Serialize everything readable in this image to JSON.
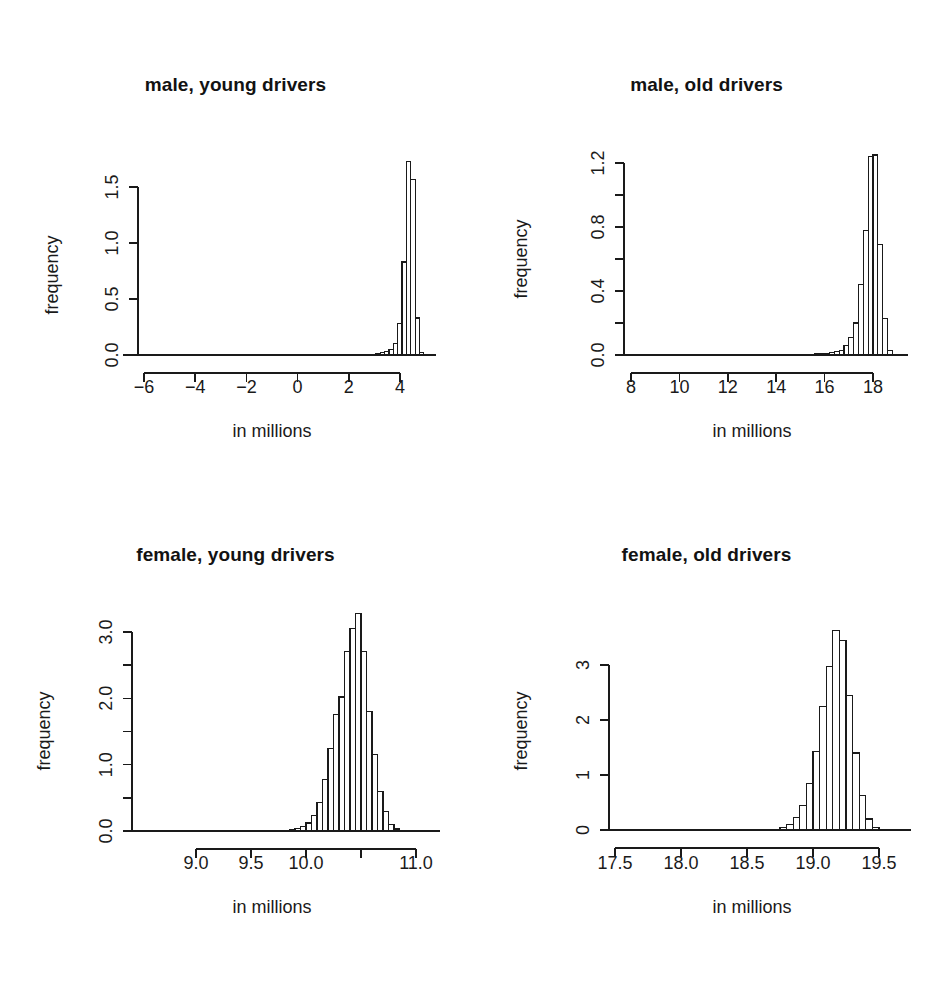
{
  "figure": {
    "width": 942,
    "height": 988,
    "background": "#ffffff",
    "ink_color": "#1a1a1a",
    "layout": "2x2 panel grid of histograms",
    "shared_xlabel": "in millions",
    "shared_ylabel": "frequency"
  },
  "chart_data": [
    {
      "id": "male-young",
      "type": "bar",
      "subtype": "histogram",
      "title": "male, young drivers",
      "xlabel": "in millions",
      "ylabel": "frequency",
      "grid": false,
      "legend": "none",
      "xlim": [
        -6.9,
        5.3
      ],
      "ylim": [
        0.0,
        1.78
      ],
      "xticks": [
        -6,
        -4,
        -2,
        0,
        2,
        4
      ],
      "xtick_labels": [
        "−6",
        "−4",
        "−2",
        "0",
        "2",
        "4"
      ],
      "yticks": [
        0.0,
        0.5,
        1.0,
        1.5
      ],
      "ytick_labels": [
        "0.0",
        "0.5",
        "1.0",
        "1.5"
      ],
      "ytick_minor": [],
      "bin_width": 0.17,
      "bins": [
        {
          "x0": -6.8,
          "x1": -6.63,
          "height": 0.0
        },
        {
          "x0": -6.63,
          "x1": -6.46,
          "height": 0.0
        },
        {
          "x0": -6.46,
          "x1": -6.29,
          "height": 0.0
        },
        {
          "x0": -6.29,
          "x1": -6.12,
          "height": 0.0
        },
        {
          "x0": -6.12,
          "x1": -5.95,
          "height": 0.0
        },
        {
          "x0": 2.55,
          "x1": 2.72,
          "height": 0.004
        },
        {
          "x0": 2.72,
          "x1": 2.89,
          "height": 0.006
        },
        {
          "x0": 2.89,
          "x1": 3.06,
          "height": 0.008
        },
        {
          "x0": 3.06,
          "x1": 3.23,
          "height": 0.012
        },
        {
          "x0": 3.23,
          "x1": 3.4,
          "height": 0.02
        },
        {
          "x0": 3.4,
          "x1": 3.57,
          "height": 0.03
        },
        {
          "x0": 3.57,
          "x1": 3.74,
          "height": 0.05
        },
        {
          "x0": 3.74,
          "x1": 3.91,
          "height": 0.1
        },
        {
          "x0": 3.91,
          "x1": 4.08,
          "height": 0.28
        },
        {
          "x0": 4.08,
          "x1": 4.25,
          "height": 0.83
        },
        {
          "x0": 4.25,
          "x1": 4.42,
          "height": 1.73
        },
        {
          "x0": 4.42,
          "x1": 4.59,
          "height": 1.57
        },
        {
          "x0": 4.59,
          "x1": 4.76,
          "height": 0.33
        },
        {
          "x0": 4.76,
          "x1": 4.93,
          "height": 0.02
        }
      ]
    },
    {
      "id": "male-old",
      "type": "bar",
      "subtype": "histogram",
      "title": "male, old drivers",
      "xlabel": "in millions",
      "ylabel": "frequency",
      "grid": false,
      "legend": "none",
      "xlim": [
        7.0,
        19.2
      ],
      "ylim": [
        0.0,
        1.3
      ],
      "xticks": [
        8,
        10,
        12,
        14,
        16,
        18
      ],
      "xtick_labels": [
        "8",
        "10",
        "12",
        "14",
        "16",
        "18"
      ],
      "yticks": [
        0.0,
        0.4,
        0.8,
        1.2
      ],
      "ytick_labels": [
        "0.0",
        "0.4",
        "0.8",
        "1.2"
      ],
      "ytick_minor": [
        0.2,
        0.6,
        1.0
      ],
      "bin_width": 0.2,
      "bins": [
        {
          "x0": 15.6,
          "x1": 15.8,
          "height": 0.006
        },
        {
          "x0": 15.8,
          "x1": 16.0,
          "height": 0.008
        },
        {
          "x0": 16.0,
          "x1": 16.2,
          "height": 0.01
        },
        {
          "x0": 16.2,
          "x1": 16.4,
          "height": 0.015
        },
        {
          "x0": 16.4,
          "x1": 16.6,
          "height": 0.02
        },
        {
          "x0": 16.6,
          "x1": 16.8,
          "height": 0.03
        },
        {
          "x0": 16.8,
          "x1": 17.0,
          "height": 0.06
        },
        {
          "x0": 17.0,
          "x1": 17.2,
          "height": 0.11
        },
        {
          "x0": 17.2,
          "x1": 17.4,
          "height": 0.2
        },
        {
          "x0": 17.4,
          "x1": 17.6,
          "height": 0.44
        },
        {
          "x0": 17.6,
          "x1": 17.8,
          "height": 0.78
        },
        {
          "x0": 17.8,
          "x1": 18.0,
          "height": 1.24
        },
        {
          "x0": 18.0,
          "x1": 18.2,
          "height": 1.25
        },
        {
          "x0": 18.2,
          "x1": 18.4,
          "height": 0.69
        },
        {
          "x0": 18.4,
          "x1": 18.6,
          "height": 0.23
        },
        {
          "x0": 18.6,
          "x1": 18.8,
          "height": 0.03
        }
      ]
    },
    {
      "id": "female-young",
      "type": "bar",
      "subtype": "histogram",
      "title": "female, young drivers",
      "xlabel": "in millions",
      "ylabel": "frequency",
      "grid": false,
      "legend": "none",
      "xlim": [
        8.72,
        11.12
      ],
      "ylim": [
        0.0,
        3.35
      ],
      "xticks": [
        9.0,
        9.5,
        10.0,
        10.5,
        11.0
      ],
      "xtick_labels": [
        "9.0",
        "9.5",
        "10.0",
        "",
        "11.0"
      ],
      "yticks": [
        0.0,
        0.5,
        1.0,
        1.5,
        2.0,
        2.5,
        3.0
      ],
      "ytick_labels": [
        "0.0",
        "",
        "1.0",
        "",
        "2.0",
        "",
        "3.0"
      ],
      "ytick_minor": [],
      "bin_width": 0.05,
      "bins": [
        {
          "x0": 9.85,
          "x1": 9.9,
          "height": 0.02
        },
        {
          "x0": 9.9,
          "x1": 9.95,
          "height": 0.04
        },
        {
          "x0": 9.95,
          "x1": 10.0,
          "height": 0.07
        },
        {
          "x0": 10.0,
          "x1": 10.05,
          "height": 0.12
        },
        {
          "x0": 10.05,
          "x1": 10.1,
          "height": 0.23
        },
        {
          "x0": 10.1,
          "x1": 10.15,
          "height": 0.43
        },
        {
          "x0": 10.15,
          "x1": 10.2,
          "height": 0.78
        },
        {
          "x0": 10.2,
          "x1": 10.25,
          "height": 1.25
        },
        {
          "x0": 10.25,
          "x1": 10.3,
          "height": 1.75
        },
        {
          "x0": 10.3,
          "x1": 10.35,
          "height": 2.02
        },
        {
          "x0": 10.35,
          "x1": 10.4,
          "height": 2.7
        },
        {
          "x0": 10.4,
          "x1": 10.45,
          "height": 3.05
        },
        {
          "x0": 10.45,
          "x1": 10.5,
          "height": 3.28
        },
        {
          "x0": 10.5,
          "x1": 10.55,
          "height": 2.7
        },
        {
          "x0": 10.55,
          "x1": 10.6,
          "height": 1.8
        },
        {
          "x0": 10.6,
          "x1": 10.65,
          "height": 1.15
        },
        {
          "x0": 10.65,
          "x1": 10.7,
          "height": 0.6
        },
        {
          "x0": 10.7,
          "x1": 10.75,
          "height": 0.3
        },
        {
          "x0": 10.75,
          "x1": 10.8,
          "height": 0.1
        },
        {
          "x0": 10.8,
          "x1": 10.85,
          "height": 0.03
        }
      ]
    },
    {
      "id": "female-old",
      "type": "bar",
      "subtype": "histogram",
      "title": "female, old drivers",
      "xlabel": "in millions",
      "ylabel": "frequency",
      "grid": false,
      "legend": "none",
      "xlim": [
        17.28,
        19.72
      ],
      "ylim": [
        0.0,
        3.8
      ],
      "xticks": [
        17.5,
        18.0,
        18.5,
        19.0,
        19.5
      ],
      "xtick_labels": [
        "17.5",
        "18.0",
        "18.5",
        "19.0",
        "19.5"
      ],
      "yticks": [
        0,
        1,
        2,
        3
      ],
      "ytick_labels": [
        "0",
        "1",
        "2",
        "3"
      ],
      "ytick_minor": [],
      "bin_width": 0.05,
      "bins": [
        {
          "x0": 18.75,
          "x1": 18.8,
          "height": 0.04
        },
        {
          "x0": 18.8,
          "x1": 18.85,
          "height": 0.1
        },
        {
          "x0": 18.85,
          "x1": 18.9,
          "height": 0.22
        },
        {
          "x0": 18.9,
          "x1": 18.95,
          "height": 0.45
        },
        {
          "x0": 18.95,
          "x1": 19.0,
          "height": 0.85
        },
        {
          "x0": 19.0,
          "x1": 19.05,
          "height": 1.42
        },
        {
          "x0": 19.05,
          "x1": 19.1,
          "height": 2.25
        },
        {
          "x0": 19.1,
          "x1": 19.15,
          "height": 2.98
        },
        {
          "x0": 19.15,
          "x1": 19.2,
          "height": 3.62
        },
        {
          "x0": 19.2,
          "x1": 19.25,
          "height": 3.45
        },
        {
          "x0": 19.25,
          "x1": 19.3,
          "height": 2.45
        },
        {
          "x0": 19.3,
          "x1": 19.35,
          "height": 1.4
        },
        {
          "x0": 19.35,
          "x1": 19.4,
          "height": 0.62
        },
        {
          "x0": 19.4,
          "x1": 19.45,
          "height": 0.2
        },
        {
          "x0": 19.45,
          "x1": 19.5,
          "height": 0.05
        }
      ]
    }
  ]
}
